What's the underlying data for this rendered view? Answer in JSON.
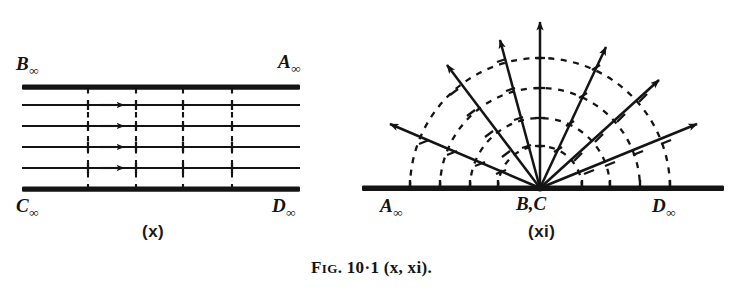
{
  "figure": {
    "caption_prefix": "F",
    "caption_smallcaps": "IG",
    "caption_rest": ". 10·1 (x, xi).",
    "caption_full": "Fɪɢ. 10·1 (x, xi)."
  },
  "panel_x": {
    "tag": "(x)",
    "labels": {
      "top_left": "B",
      "top_left_sub": "∞",
      "top_right": "A",
      "top_right_sub": "∞",
      "bottom_left": "C",
      "bottom_left_sub": "∞",
      "bottom_right": "D",
      "bottom_right_sub": "∞"
    },
    "description": "plane-wave rays between two parallel rigid boundaries",
    "boundary_count": 2,
    "ray_count": 4,
    "wavefront_count": 4,
    "arrow_count": 4
  },
  "panel_xi": {
    "tag": "(xi)",
    "labels": {
      "left": "A",
      "left_sub": "∞",
      "center": "B,C",
      "right": "D",
      "right_sub": "∞"
    },
    "description": "cylindrical wave rays diverging from a point source on a rigid baseline",
    "ray_count": 7,
    "arc_count": 4,
    "ray_angles_deg": [
      22,
      42,
      65,
      90,
      105,
      127,
      150
    ],
    "arc_radii": [
      42,
      70,
      100,
      130
    ]
  },
  "colors": {
    "ink": "#141414",
    "paper": "#ffffff"
  }
}
